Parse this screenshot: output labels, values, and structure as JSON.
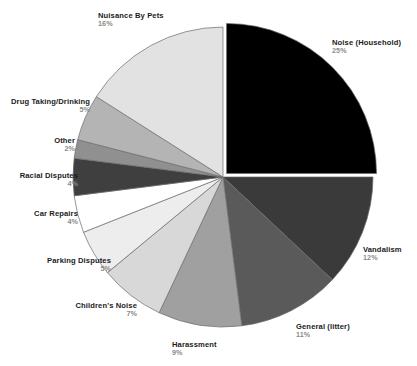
{
  "chart_data": {
    "type": "pie",
    "title": "",
    "subtitle": "",
    "xlabel": "",
    "ylabel": "",
    "legend_position": "none",
    "grid": false,
    "start_angle_deg": 0,
    "direction": "clockwise",
    "units": "percent",
    "total": 100,
    "categories": [
      "Noise (Household)",
      "Vandalism",
      "General (litter)",
      "Harassment",
      "Children's Noise",
      "Parking Disputes",
      "Car Repairs",
      "Racial Disputes",
      "Other",
      "Drug Taking/Drinking",
      "Nuisance By Pets"
    ],
    "values": [
      25,
      12,
      11,
      9,
      7,
      5,
      4,
      4,
      2,
      5,
      16
    ],
    "value_labels": [
      "25%",
      "12%",
      "11%",
      "9%",
      "7%",
      "5%",
      "4%",
      "4%",
      "2%",
      "5%",
      "16%"
    ],
    "slice_colors": [
      "#000000",
      "#3a3a3a",
      "#5a5a5a",
      "#a0a0a0",
      "#d8d8d8",
      "#ededed",
      "#ffffff",
      "#3f3f3f",
      "#909090",
      "#b4b4b4",
      "#e2e2e2"
    ],
    "exploded": [
      true,
      false,
      false,
      false,
      false,
      false,
      false,
      false,
      false,
      false,
      false
    ],
    "slices": [
      {
        "label": "Noise (Household)",
        "value": 25,
        "pct_text": "25%",
        "color": "#000000",
        "align": "left",
        "lx": 332,
        "ly": 39,
        "exploded": true
      },
      {
        "label": "Vandalism",
        "value": 12,
        "pct_text": "12%",
        "color": "#3a3a3a",
        "align": "left",
        "lx": 363,
        "ly": 246,
        "exploded": false
      },
      {
        "label": "General (litter)",
        "value": 11,
        "pct_text": "11%",
        "color": "#5a5a5a",
        "align": "left",
        "lx": 296,
        "ly": 323,
        "exploded": false
      },
      {
        "label": "Harassment",
        "value": 9,
        "pct_text": "9%",
        "color": "#a0a0a0",
        "align": "left",
        "lx": 172,
        "ly": 341,
        "exploded": false
      },
      {
        "label": "Children's Noise",
        "value": 7,
        "pct_text": "7%",
        "color": "#d8d8d8",
        "align": "right",
        "lx": 137,
        "ly": 302,
        "exploded": false
      },
      {
        "label": "Parking Disputes",
        "value": 5,
        "pct_text": "5%",
        "color": "#ededed",
        "align": "right",
        "lx": 111,
        "ly": 257,
        "exploded": false
      },
      {
        "label": "Car Repairs",
        "value": 4,
        "pct_text": "4%",
        "color": "#ffffff",
        "align": "right",
        "lx": 78,
        "ly": 210,
        "exploded": false
      },
      {
        "label": "Racial Disputes",
        "value": 4,
        "pct_text": "4%",
        "color": "#3f3f3f",
        "align": "right",
        "lx": 78,
        "ly": 172,
        "exploded": false
      },
      {
        "label": "Other",
        "value": 2,
        "pct_text": "2%",
        "color": "#909090",
        "align": "right",
        "lx": 75,
        "ly": 137,
        "exploded": false
      },
      {
        "label": "Drug Taking/Drinking",
        "value": 5,
        "pct_text": "5%",
        "color": "#b4b4b4",
        "align": "right",
        "lx": 90,
        "ly": 98,
        "exploded": false
      },
      {
        "label": "Nuisance By Pets",
        "value": 16,
        "pct_text": "16%",
        "color": "#e2e2e2",
        "align": "left",
        "lx": 98,
        "ly": 12,
        "exploded": false
      }
    ],
    "geometry": {
      "cx": 223,
      "cy": 177,
      "r": 150,
      "explode_offset": 5,
      "stroke": "#6b6b6b",
      "stroke_width": 0.7
    }
  }
}
